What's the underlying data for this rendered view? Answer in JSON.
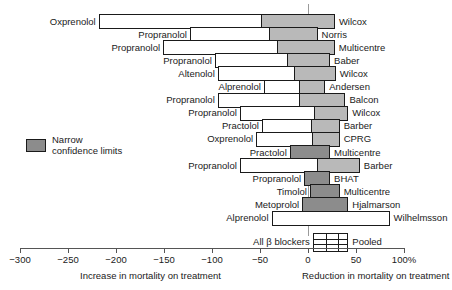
{
  "chart_data": {
    "type": "bar",
    "title": "",
    "xlabel": "",
    "ylabel": "",
    "xlim": [
      -300,
      100
    ],
    "xunit": "%",
    "grid": false,
    "axis": {
      "ticks": [
        -300,
        -250,
        -200,
        -150,
        -100,
        -50,
        0,
        50,
        100
      ],
      "tick_labels": [
        "−300",
        "−250",
        "−200",
        "−150",
        "−100",
        "−50",
        "0",
        "50",
        "100%"
      ],
      "left_title": "Increase in mortality on treatment",
      "right_title": "Reduction in mortality on treatment",
      "zero_reference": 0
    },
    "legend": {
      "position": "left-middle",
      "swatch_color": "#8c8c8c",
      "label": "Narrow\nconfidence limits"
    },
    "colors": {
      "wide_interval": "#ffffff",
      "narrow_interval": "#b9b9b9",
      "narrow_solid": "#8c8c8c",
      "outline": "#1a1a1a",
      "zero_line": "#9a9a9a"
    },
    "pooled": {
      "drug": "All β blockers",
      "study": "Pooled",
      "low": 5,
      "high": 42
    },
    "series_note": "Each row is a confidence interval for percentage reduction in mortality; shaded portion marks narrow confidence limits.",
    "categories": [
      "Wilcox",
      "Norris",
      "Multicentre",
      "Baber",
      "Wilcox",
      "Andersen",
      "Balcon",
      "Wilcox",
      "Barber",
      "CPRG",
      "Multicentre",
      "Barber",
      "BHAT",
      "Multicentre",
      "Hjalmarson",
      "Wilhelmsson"
    ],
    "rows": [
      {
        "drug": "Oxprenolol",
        "study": "Wilcox",
        "low": -218,
        "high": 28,
        "narrow_from": -48,
        "shade": "narrow"
      },
      {
        "drug": "Propranolol",
        "study": "Norris",
        "low": -123,
        "high": 10,
        "narrow_from": -40,
        "shade": "narrow"
      },
      {
        "drug": "Propranolol",
        "study": "Multicentre",
        "low": -151,
        "high": 28,
        "narrow_from": -31,
        "shade": "narrow"
      },
      {
        "drug": "Propranolol",
        "study": "Baber",
        "low": -97,
        "high": 23,
        "narrow_from": -21,
        "shade": "narrow"
      },
      {
        "drug": "Altenolol",
        "study": "Wilcox",
        "low": -94,
        "high": 29,
        "narrow_from": -14,
        "shade": "narrow"
      },
      {
        "drug": "Alprenolol",
        "study": "Andersen",
        "low": -46,
        "high": 18,
        "narrow_from": -8,
        "shade": "narrow"
      },
      {
        "drug": "Propranolol",
        "study": "Balcon",
        "low": -94,
        "high": 39,
        "narrow_from": -8,
        "shade": "narrow"
      },
      {
        "drug": "Propranolol",
        "study": "Wilcox",
        "low": -71,
        "high": 42,
        "narrow_from": 7,
        "shade": "narrow"
      },
      {
        "drug": "Practolol",
        "study": "Barber",
        "low": -48,
        "high": 33,
        "narrow_from": 4,
        "shade": "narrow"
      },
      {
        "drug": "Oxprenolol",
        "study": "CPRG",
        "low": -54,
        "high": 33,
        "narrow_from": 5,
        "shade": "narrow"
      },
      {
        "drug": "Practolol",
        "study": "Multicentre",
        "low": -19,
        "high": 23,
        "narrow_from": -19,
        "shade": "dark"
      },
      {
        "drug": "Propranolol",
        "study": "Barber",
        "low": -71,
        "high": 54,
        "narrow_from": 10,
        "shade": "narrow"
      },
      {
        "drug": "Propranolol",
        "study": "BHAT",
        "low": -4,
        "high": 23,
        "narrow_from": -4,
        "shade": "dark"
      },
      {
        "drug": "Timolol",
        "study": "Multicentre",
        "low": 2,
        "high": 33,
        "narrow_from": 2,
        "shade": "dark"
      },
      {
        "drug": "Metoprolol",
        "study": "Hjalmarson",
        "low": -6,
        "high": 42,
        "narrow_from": -6,
        "shade": "dark"
      },
      {
        "drug": "Alprenolol",
        "study": "Wilhelmsson",
        "low": -38,
        "high": 85,
        "narrow_from": null,
        "shade": "none"
      }
    ]
  }
}
